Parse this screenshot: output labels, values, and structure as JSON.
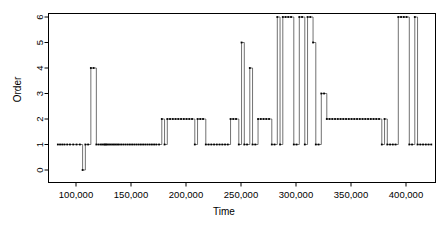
{
  "chart_data": {
    "type": "line",
    "title": "",
    "xlabel": "Time",
    "ylabel": "Order",
    "xlim": [
      83000,
      425000
    ],
    "ylim": [
      0,
      6
    ],
    "xticks": [
      100000,
      150000,
      200000,
      250000,
      300000,
      350000,
      400000
    ],
    "xticklabels": [
      "100,000",
      "150,000",
      "200,000",
      "250,000",
      "300,000",
      "350,000",
      "400,000"
    ],
    "yticks": [
      0,
      1,
      2,
      3,
      4,
      5,
      6
    ],
    "yticklabels": [
      "0",
      "1",
      "2",
      "3",
      "4",
      "5",
      "6"
    ],
    "grid": false,
    "legend": null,
    "line_color": "#4d4d4d",
    "marker_color": "#000000",
    "marker": "point",
    "drawstyle": "steps-post",
    "series": [
      {
        "name": "Order",
        "x": [
          83500,
          85500,
          87500,
          89500,
          92000,
          94500,
          97500,
          100500,
          103500,
          106000,
          108500,
          111000,
          113500,
          116000,
          118500,
          120500,
          122500,
          124000,
          125500,
          126500,
          127500,
          128500,
          130000,
          131500,
          133000,
          134500,
          136000,
          137500,
          139000,
          141000,
          143000,
          145000,
          147000,
          149000,
          151000,
          153000,
          155000,
          157000,
          159000,
          161000,
          163000,
          165000,
          167000,
          169000,
          171000,
          173000,
          175500,
          178000,
          180500,
          183000,
          185500,
          188000,
          190500,
          193000,
          195500,
          198000,
          200500,
          203000,
          205500,
          208000,
          210500,
          213000,
          215500,
          218000,
          220500,
          223000,
          225500,
          228000,
          230500,
          233000,
          235500,
          238000,
          240500,
          243000,
          245500,
          248000,
          250500,
          253000,
          255500,
          258000,
          260500,
          263000,
          265500,
          268000,
          270500,
          273000,
          275500,
          278000,
          280500,
          283000,
          285500,
          288000,
          290500,
          293000,
          295500,
          298000,
          300500,
          303000,
          305500,
          308000,
          310500,
          313000,
          315500,
          318000,
          320500,
          323000,
          325500,
          328000,
          330500,
          333000,
          335500,
          338000,
          340500,
          343000,
          345500,
          348000,
          350500,
          353000,
          355500,
          358000,
          360500,
          363000,
          365500,
          368000,
          370500,
          373000,
          375500,
          378000,
          380500,
          383000,
          385500,
          388000,
          390500,
          393000,
          395500,
          398000,
          400500,
          403000,
          405500,
          408000,
          410500,
          413000,
          415500,
          418000,
          420500,
          423000
        ],
        "values": [
          1,
          1,
          1,
          1,
          1,
          1,
          1,
          1,
          1,
          0,
          1,
          1,
          4,
          4,
          1,
          1,
          1,
          1,
          1,
          1,
          1,
          1,
          1,
          1,
          1,
          1,
          1,
          1,
          1,
          1,
          1,
          1,
          1,
          1,
          1,
          1,
          1,
          1,
          1,
          1,
          1,
          1,
          1,
          1,
          1,
          1,
          1,
          2,
          1,
          2,
          2,
          2,
          2,
          2,
          2,
          2,
          2,
          2,
          2,
          1,
          2,
          2,
          2,
          1,
          1,
          1,
          1,
          1,
          1,
          1,
          1,
          1,
          2,
          2,
          2,
          1,
          5,
          1,
          1,
          4,
          1,
          1,
          2,
          2,
          2,
          2,
          2,
          1,
          1,
          6,
          1,
          6,
          6,
          6,
          6,
          1,
          1,
          6,
          6,
          1,
          6,
          6,
          5,
          1,
          1,
          3,
          3,
          2,
          2,
          2,
          2,
          2,
          2,
          2,
          2,
          2,
          2,
          2,
          2,
          2,
          2,
          2,
          2,
          2,
          2,
          2,
          2,
          1,
          2,
          1,
          1,
          1,
          1,
          6,
          6,
          6,
          6,
          1,
          1,
          6,
          1,
          1,
          1,
          1,
          1,
          1
        ]
      }
    ]
  },
  "axes": {
    "y_title": "Order",
    "x_title": "Time"
  }
}
